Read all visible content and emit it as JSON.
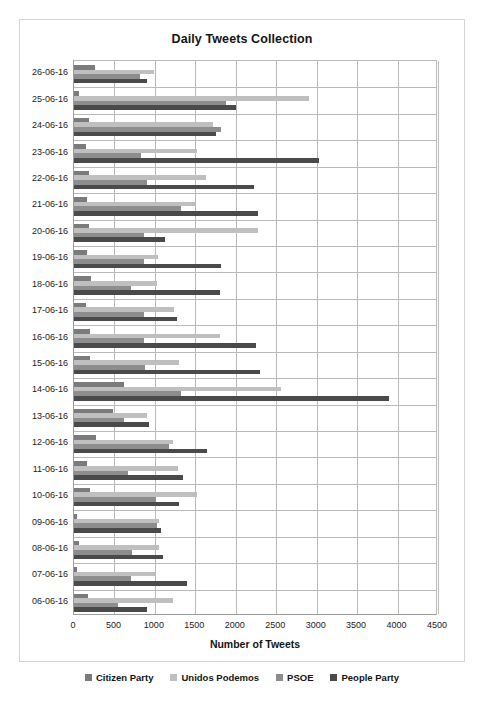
{
  "chart_data": {
    "type": "bar",
    "orientation": "horizontal",
    "title": "Daily Tweets Collection",
    "xlabel": "Number of Tweets",
    "ylabel": "",
    "xlim": [
      0,
      4500
    ],
    "xticks": [
      0,
      500,
      1000,
      1500,
      2000,
      2500,
      3000,
      3500,
      4000,
      4500
    ],
    "grid": "vertical-and-horizontal",
    "legend_position": "bottom",
    "categories": [
      "26-06-16",
      "25-06-16",
      "24-06-16",
      "23-06-16",
      "22-06-16",
      "21-06-16",
      "20-06-16",
      "19-06-16",
      "18-06-16",
      "17-06-16",
      "16-06-16",
      "15-06-16",
      "14-06-16",
      "13-06-16",
      "12-06-16",
      "11-06-16",
      "10-06-16",
      "09-06-16",
      "08-06-16",
      "07-06-16",
      "06-06-16"
    ],
    "series": [
      {
        "name": "Citizen Party",
        "color": "#7b7b7b",
        "values": [
          260,
          60,
          180,
          150,
          190,
          160,
          190,
          160,
          210,
          150,
          200,
          200,
          620,
          480,
          270,
          160,
          200,
          40,
          60,
          40,
          170
        ]
      },
      {
        "name": "Unidos Podemos",
        "color": "#bfbfbf",
        "values": [
          990,
          2900,
          1720,
          1520,
          1630,
          1500,
          2280,
          1040,
          1030,
          1240,
          1810,
          1300,
          2560,
          900,
          1230,
          1290,
          1520,
          1050,
          1050,
          1000,
          1220
        ]
      },
      {
        "name": "PSOE",
        "color": "#8d8d8d",
        "values": [
          820,
          1880,
          1820,
          830,
          900,
          1320,
          870,
          870,
          700,
          870,
          860,
          880,
          1320,
          620,
          1170,
          670,
          1010,
          1020,
          720,
          700,
          540
        ]
      },
      {
        "name": "People Party",
        "color": "#4a4a4a",
        "values": [
          900,
          2000,
          1750,
          3030,
          2230,
          2280,
          1120,
          1820,
          1800,
          1270,
          2250,
          2300,
          3890,
          930,
          1650,
          1350,
          1300,
          1080,
          1100,
          1400,
          900
        ]
      }
    ]
  },
  "legend": {
    "items": [
      {
        "label": "Citizen Party",
        "color": "#7b7b7b"
      },
      {
        "label": "Unidos Podemos",
        "color": "#bfbfbf"
      },
      {
        "label": "PSOE",
        "color": "#8d8d8d"
      },
      {
        "label": "People Party",
        "color": "#4a4a4a"
      }
    ]
  }
}
